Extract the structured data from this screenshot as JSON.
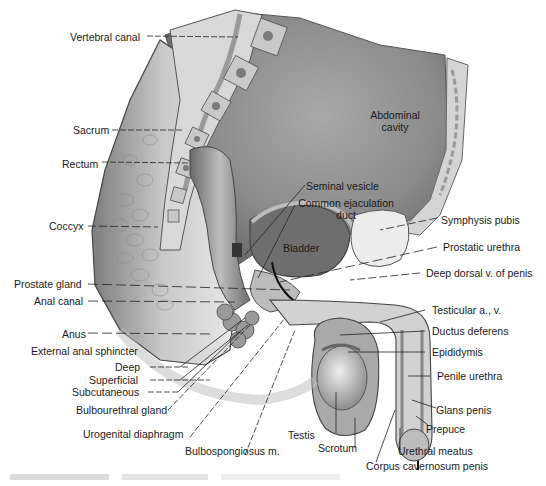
{
  "figure": {
    "type": "anatomical-illustration",
    "colors": {
      "background": "#ffffff",
      "cavity": "#8c8c8c",
      "cavity_dark": "#5a5a5a",
      "tissue_light": "#d9d9d9",
      "tissue_mid": "#b5b5b5",
      "bone": "#cfcfcf",
      "bone_marrow": "#7a7a7a",
      "line": "#222222",
      "text": "#1a1a1a"
    }
  },
  "labels": {
    "vertebral_canal": "Vertebral canal",
    "abdominal_cavity_1": "Abdominal",
    "abdominal_cavity_2": "cavity",
    "sacrum": "Sacrum",
    "rectum": "Rectum",
    "seminal_vesicle": "Seminal vesicle",
    "common_ejaculation_duct_1": "Common ejaculation",
    "common_ejaculation_duct_2": "duct",
    "coccyx": "Coccyx",
    "symphysis_pubis": "Symphysis pubis",
    "bladder": "Bladder",
    "prostatic_urethra": "Prostatic urethra",
    "prostate_gland": "Prostate gland",
    "deep_dorsal_vein": "Deep dorsal v. of penis",
    "anal_canal": "Anal canal",
    "testicular_av": "Testicular a., v.",
    "anus": "Anus",
    "ductus_deferens": "Ductus deferens",
    "external_anal_sphincter": "External anal sphincter",
    "epididymis": "Epididymis",
    "deep": "Deep",
    "superficial": "Superficial",
    "penile_urethra": "Penile urethra",
    "subcutaneous": "Subcutaneous",
    "bulbourethral_gland": "Bulbourethral gland",
    "glans_penis": "Glans penis",
    "prepuce": "Prepuce",
    "testis": "Testis",
    "urogenital_diaphragm": "Urogenital diaphragm",
    "scrotum": "Scrotum",
    "urethral_meatus": "Urethral meatus",
    "bulbospongiosus": "Bulbospongiosus m.",
    "corpus_cavernosum": "Corpus cavernosum penis"
  }
}
